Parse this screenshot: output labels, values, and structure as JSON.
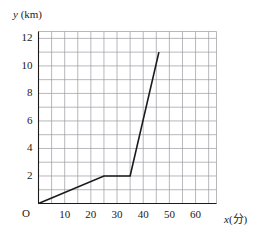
{
  "chart_data": {
    "type": "line",
    "title": "",
    "xlabel": "x(分)",
    "ylabel": "y (km)",
    "xlim": [
      0,
      68
    ],
    "ylim": [
      0,
      12.5
    ],
    "grid": true,
    "grid_x_step": 5,
    "grid_y_step": 1,
    "legend": "none",
    "origin_label": "O",
    "x_ticks": [
      {
        "value": 10,
        "label": "10"
      },
      {
        "value": 20,
        "label": "20"
      },
      {
        "value": 30,
        "label": "30"
      },
      {
        "value": 40,
        "label": "40"
      },
      {
        "value": 50,
        "label": "50"
      },
      {
        "value": 60,
        "label": "60"
      }
    ],
    "y_ticks": [
      {
        "value": 2,
        "label": "2"
      },
      {
        "value": 4,
        "label": "4"
      },
      {
        "value": 6,
        "label": "6"
      },
      {
        "value": 8,
        "label": "8"
      },
      {
        "value": 10,
        "label": "10"
      },
      {
        "value": 12,
        "label": "12"
      }
    ],
    "series": [
      {
        "name": "distance",
        "color": "#1a1a1a",
        "points": [
          {
            "x": 0,
            "y": 0
          },
          {
            "x": 25,
            "y": 2
          },
          {
            "x": 35,
            "y": 2
          },
          {
            "x": 46,
            "y": 11
          }
        ]
      }
    ],
    "axis_label_parts": {
      "y_var": "y",
      "y_unit": "(km)",
      "x_var": "x",
      "x_unit": "(分)"
    }
  }
}
